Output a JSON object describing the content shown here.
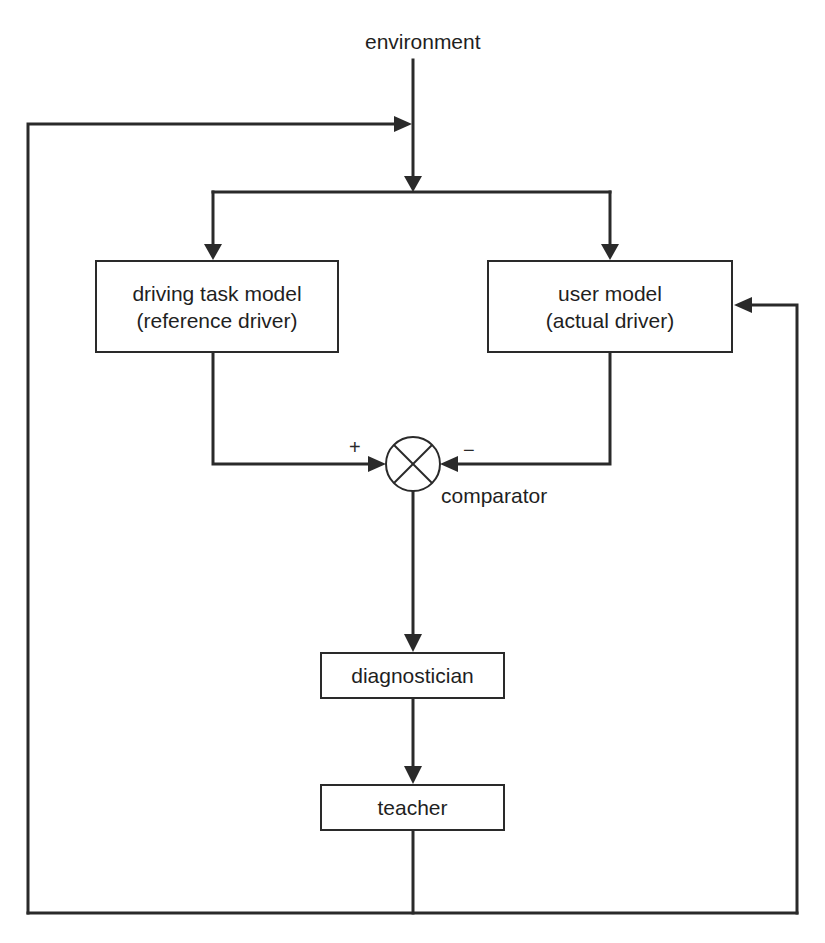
{
  "diagram": {
    "type": "feedback-block-diagram",
    "nodes": {
      "environment": {
        "label": "environment"
      },
      "driving_task_model": {
        "line1": "driving task model",
        "line2": "(reference driver)"
      },
      "user_model": {
        "line1": "user model",
        "line2": "(actual driver)"
      },
      "comparator": {
        "label": "comparator",
        "plus_sign": "+",
        "minus_sign": "−"
      },
      "diagnostician": {
        "label": "diagnostician"
      },
      "teacher": {
        "label": "teacher"
      }
    },
    "edges": [
      {
        "from": "environment",
        "to": "driving_task_model"
      },
      {
        "from": "environment",
        "to": "user_model"
      },
      {
        "from": "driving_task_model",
        "to": "comparator",
        "sign": "+"
      },
      {
        "from": "user_model",
        "to": "comparator",
        "sign": "−"
      },
      {
        "from": "comparator",
        "to": "diagnostician"
      },
      {
        "from": "diagnostician",
        "to": "teacher"
      },
      {
        "from": "teacher",
        "to": "environment"
      },
      {
        "from": "teacher",
        "to": "user_model"
      }
    ],
    "colors": {
      "line": "#2a2a2a",
      "background": "#ffffff"
    }
  }
}
